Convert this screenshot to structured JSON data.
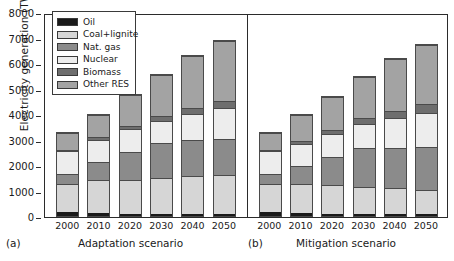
{
  "chart_data": {
    "type": "bar",
    "subtype": "stacked-bar",
    "title": "",
    "ylabel": "Electricity generation (TWh)",
    "xlabel": "",
    "ylim": [
      0,
      8000
    ],
    "yticks": [
      0,
      1000,
      2000,
      3000,
      4000,
      5000,
      6000,
      7000,
      8000
    ],
    "ytick_labels": [
      "0",
      "1000",
      "2000",
      "3000",
      "4000",
      "5000",
      "6000",
      "7000",
      "8000"
    ],
    "grid": false,
    "legend_position": "upper left",
    "categories": [
      "2000",
      "2010",
      "2020",
      "2030",
      "2040",
      "2050"
    ],
    "legend": [
      {
        "name": "Oil",
        "color": "#1a1a1a"
      },
      {
        "name": "Coal+lignite",
        "color": "#d6d6d6"
      },
      {
        "name": "Nat. gas",
        "color": "#8b8b8b"
      },
      {
        "name": "Nuclear",
        "color": "#ededed"
      },
      {
        "name": "Biomass",
        "color": "#6e6e6e"
      },
      {
        "name": "Other RES",
        "color": "#a3a3a3"
      }
    ],
    "panels": [
      {
        "tag": "(a)",
        "label": "Adaptation scenario",
        "categories": [
          "2000",
          "2010",
          "2020",
          "2030",
          "2040",
          "2050"
        ],
        "totals": [
          3340,
          4040,
          4840,
          5620,
          6350,
          6940
        ],
        "series": [
          {
            "name": "Oil",
            "color": "#1a1a1a",
            "values": [
              150,
              120,
              100,
              90,
              80,
              70
            ]
          },
          {
            "name": "Coal+lignite",
            "color": "#d6d6d6",
            "values": [
              1150,
              1330,
              1350,
              1420,
              1500,
              1560
            ]
          },
          {
            "name": "Nat. gas",
            "color": "#8b8b8b",
            "values": [
              400,
              700,
              1100,
              1380,
              1420,
              1440
            ]
          },
          {
            "name": "Nuclear",
            "color": "#ededed",
            "values": [
              900,
              900,
              900,
              900,
              1050,
              1200
            ]
          },
          {
            "name": "Biomass",
            "color": "#6e6e6e",
            "values": [
              60,
              100,
              150,
              200,
              250,
              280
            ]
          },
          {
            "name": "Other RES",
            "color": "#a3a3a3",
            "values": [
              680,
              890,
              1240,
              1630,
              2050,
              2390
            ]
          }
        ]
      },
      {
        "tag": "(b)",
        "label": "Mitigation scenario",
        "categories": [
          "2000",
          "2010",
          "2020",
          "2030",
          "2040",
          "2050"
        ],
        "totals": [
          3340,
          4030,
          4740,
          5520,
          6240,
          6800
        ],
        "series": [
          {
            "name": "Oil",
            "color": "#1a1a1a",
            "values": [
              150,
              120,
              100,
              85,
              75,
              65
            ]
          },
          {
            "name": "Coal+lignite",
            "color": "#d6d6d6",
            "values": [
              1150,
              1180,
              1130,
              1070,
              1020,
              980
            ]
          },
          {
            "name": "Nat. gas",
            "color": "#8b8b8b",
            "values": [
              400,
              700,
              1130,
              1540,
              1620,
              1700
            ]
          },
          {
            "name": "Nuclear",
            "color": "#ededed",
            "values": [
              900,
              900,
              900,
              980,
              1160,
              1350
            ]
          },
          {
            "name": "Biomass",
            "color": "#6e6e6e",
            "values": [
              60,
              110,
              180,
              240,
              290,
              330
            ]
          },
          {
            "name": "Other RES",
            "color": "#a3a3a3",
            "values": [
              680,
              1020,
              1300,
              1605,
              2075,
              2375
            ]
          }
        ]
      }
    ]
  }
}
